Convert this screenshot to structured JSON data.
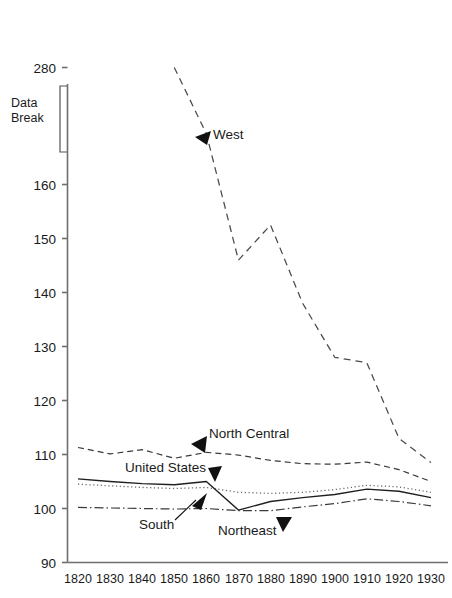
{
  "chart_data": {
    "type": "line",
    "title": "",
    "subtitle": "",
    "xlabel": "",
    "ylabel": "",
    "x": [
      1820,
      1830,
      1840,
      1850,
      1860,
      1870,
      1880,
      1890,
      1900,
      1910,
      1920,
      1930
    ],
    "xtick_labels": [
      "1820",
      "1830",
      "1840",
      "1850",
      "1860",
      "1870",
      "1880",
      "1890",
      "1900",
      "1910",
      "1920",
      "1930"
    ],
    "ytick_labels": [
      "90",
      "100",
      "110",
      "120",
      "130",
      "140",
      "150",
      "160",
      "280"
    ],
    "ytick_values": [
      90,
      100,
      110,
      120,
      130,
      140,
      150,
      160,
      280
    ],
    "ylim": [
      90,
      280
    ],
    "xlim": [
      1820,
      1930
    ],
    "grid": false,
    "legend": "inline-annotations",
    "axis_break": {
      "label": "Data Break",
      "between": [
        160,
        280
      ]
    },
    "series": [
      {
        "name": "West",
        "style": "dashed",
        "x": [
          1850,
          1860,
          1870,
          1880,
          1890,
          1900,
          1910,
          1920,
          1930
        ],
        "values": [
          280,
          186,
          146,
          152.5,
          138,
          128,
          127,
          113,
          108.5
        ]
      },
      {
        "name": "North Central",
        "style": "dashed",
        "x": [
          1820,
          1830,
          1840,
          1850,
          1860,
          1870,
          1880,
          1890,
          1900,
          1910,
          1920,
          1930
        ],
        "values": [
          111.3,
          110.1,
          110.9,
          109.3,
          110.4,
          109.9,
          108.9,
          108.3,
          108.2,
          108.6,
          107.2,
          105.0
        ]
      },
      {
        "name": "United States",
        "style": "dotted",
        "x": [
          1820,
          1830,
          1840,
          1850,
          1860,
          1870,
          1880,
          1890,
          1900,
          1910,
          1920,
          1930
        ],
        "values": [
          104.5,
          104.2,
          103.9,
          103.7,
          103.9,
          103.0,
          102.8,
          103.0,
          103.5,
          104.3,
          104.0,
          103.0
        ]
      },
      {
        "name": "South",
        "style": "solid",
        "x": [
          1820,
          1830,
          1840,
          1850,
          1860,
          1870,
          1880,
          1890,
          1900,
          1910,
          1920,
          1930
        ],
        "values": [
          105.5,
          105.0,
          104.6,
          104.4,
          105.0,
          99.7,
          101.3,
          102.0,
          102.6,
          103.6,
          103.2,
          102.0
        ]
      },
      {
        "name": "Northeast",
        "style": "dash-dot",
        "x": [
          1820,
          1830,
          1840,
          1850,
          1860,
          1870,
          1880,
          1890,
          1900,
          1910,
          1920,
          1930
        ],
        "values": [
          100.2,
          100.1,
          100.0,
          99.9,
          100.0,
          99.6,
          99.6,
          100.3,
          100.9,
          101.8,
          101.3,
          100.5
        ]
      }
    ],
    "annotations": [
      {
        "text": "West",
        "series": "West"
      },
      {
        "text": "North Central",
        "series": "North Central"
      },
      {
        "text": "United States",
        "series": "United States"
      },
      {
        "text": "South",
        "series": "South"
      },
      {
        "text": "Northeast",
        "series": "Northeast"
      }
    ]
  },
  "colors": {
    "background": "#ffffff",
    "axis": "#6e6e6e",
    "text": "#1a1a1a",
    "line": "#2b2b2b"
  }
}
